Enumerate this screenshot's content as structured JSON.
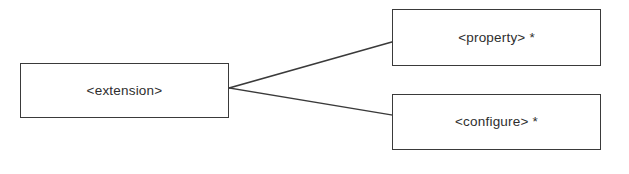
{
  "diagram": {
    "type": "entity-relationship",
    "background_color": "#ffffff",
    "stroke_color": "#3a3a3a",
    "text_color": "#2e2e2e",
    "nodes": [
      {
        "id": "extension",
        "label": "<extension>",
        "role": "parent",
        "x": 20,
        "y": 63,
        "width": 209,
        "height": 55
      },
      {
        "id": "property",
        "label": "<property> *",
        "role": "child",
        "cardinality": "*",
        "x": 392,
        "y": 9,
        "width": 209,
        "height": 57
      },
      {
        "id": "configure",
        "label": "<configure> *",
        "role": "child",
        "cardinality": "*",
        "x": 392,
        "y": 94,
        "width": 209,
        "height": 56
      }
    ],
    "connectors": [
      {
        "id": "extension-to-property",
        "from": "extension",
        "to": "property",
        "x1": 229,
        "y1": 88,
        "x2": 392,
        "y2": 42
      },
      {
        "id": "extension-to-configure",
        "from": "extension",
        "to": "configure",
        "x1": 229,
        "y1": 88,
        "x2": 392,
        "y2": 115
      }
    ]
  }
}
